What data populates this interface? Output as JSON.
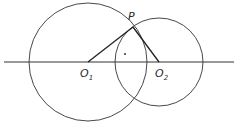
{
  "diagram": {
    "type": "geometry",
    "labels": {
      "P": "P",
      "O1_main": "O",
      "O1_sub": "1",
      "O2_main": "O",
      "O2_sub": "2"
    },
    "colors": {
      "stroke": "#333333",
      "background": "#ffffff"
    },
    "elements": {
      "line": {
        "x1": 4,
        "y1": 62,
        "x2": 234,
        "y2": 62
      },
      "circle1": {
        "cx": 88,
        "cy": 62,
        "r": 59
      },
      "circle2": {
        "cx": 159,
        "cy": 62,
        "r": 44
      },
      "P": {
        "x": 133,
        "y": 27
      },
      "dot": {
        "x": 125,
        "y": 54
      }
    }
  }
}
